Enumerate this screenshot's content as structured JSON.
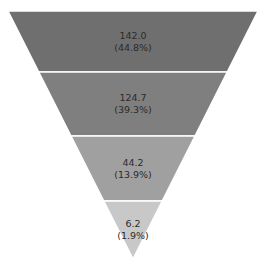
{
  "chart_data": {
    "type": "funnel",
    "title": "",
    "stages": [
      {
        "value": 142.0,
        "label": "142.0",
        "percent_label": "(44.8%)",
        "color": "#6f6f6f"
      },
      {
        "value": 124.7,
        "label": "124.7",
        "percent_label": "(39.3%)",
        "color": "#7f7f7f"
      },
      {
        "value": 44.2,
        "label": "44.2",
        "percent_label": "(13.9%)",
        "color": "#a0a0a0"
      },
      {
        "value": 6.2,
        "label": "6.2",
        "percent_label": "(1.9%)",
        "color": "#c8c8c8"
      }
    ],
    "legend": "none",
    "grid": false
  }
}
